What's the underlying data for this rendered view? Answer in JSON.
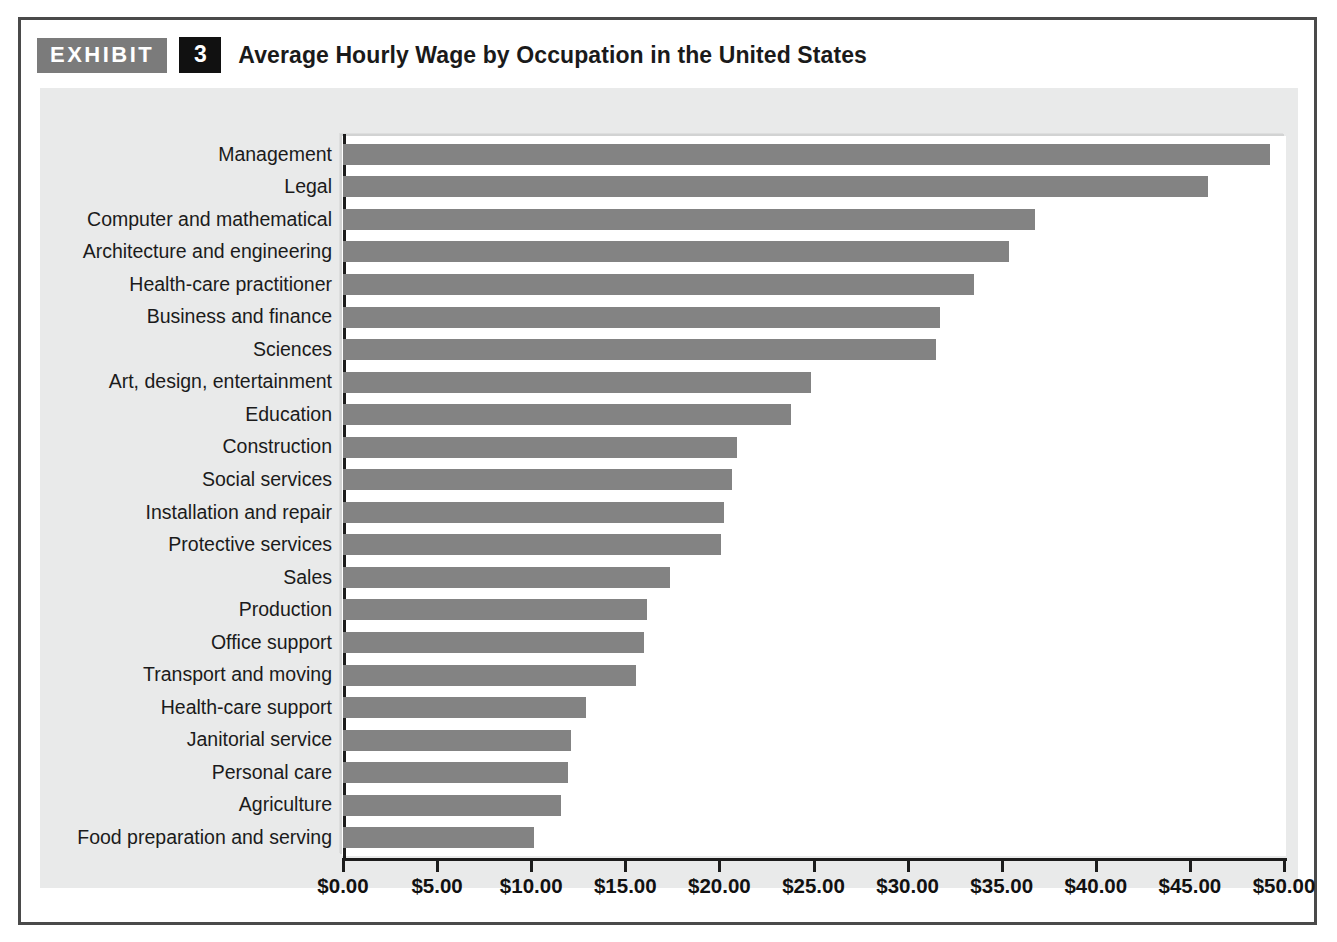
{
  "exhibit": {
    "tag_label": "EXHIBIT",
    "number": "3",
    "title": "Average Hourly Wage by Occupation in the United States"
  },
  "colors": {
    "bar_fill": "#838383",
    "exhibit_tag_bg": "#7b7b7b",
    "exhibit_number_bg": "#111111",
    "panel_bg": "#e9eaea",
    "plot_bg": "#ffffff",
    "axis": "#1c1c1c",
    "frame": "#4a4a4a"
  },
  "chart_data": {
    "type": "bar",
    "orientation": "horizontal",
    "title": "Average Hourly Wage by Occupation in the United States",
    "xlabel": "",
    "ylabel": "",
    "xlim": [
      0,
      50
    ],
    "grid": false,
    "legend": null,
    "value_prefix": "$",
    "tick_labels": [
      "$0.00",
      "$5.00",
      "$10.00",
      "$15.00",
      "$20.00",
      "$25.00",
      "$30.00",
      "$35.00",
      "$40.00",
      "$45.00",
      "$50.00"
    ],
    "ticks": [
      0,
      5,
      10,
      15,
      20,
      25,
      30,
      35,
      40,
      45,
      50
    ],
    "categories": [
      "Management",
      "Legal",
      "Computer and mathematical",
      "Architecture and engineering",
      "Health-care practitioner",
      "Business and finance",
      "Sciences",
      "Art, design, entertainment",
      "Education",
      "Construction",
      "Social services",
      "Installation and repair",
      "Protective services",
      "Sales",
      "Production",
      "Office support",
      "Transport and moving",
      "Health-care support",
      "Janitorial service",
      "Personal care",
      "Agriculture",
      "Food preparation and serving"
    ],
    "values": [
      49.25,
      45.95,
      36.75,
      35.4,
      33.55,
      31.7,
      31.5,
      24.85,
      23.8,
      20.95,
      20.65,
      20.25,
      20.1,
      17.35,
      16.15,
      16.0,
      15.55,
      12.9,
      12.1,
      11.95,
      11.6,
      10.15
    ]
  }
}
